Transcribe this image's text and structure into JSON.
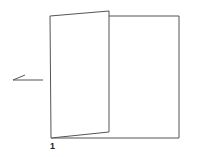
{
  "diagram": {
    "type": "fold-illustration",
    "step_label": "1",
    "stroke_color": "#555555",
    "background": "#ffffff",
    "elements": {
      "back_panel": {
        "x1": 109,
        "y1": 16,
        "x2": 179,
        "y2": 138
      },
      "folding_panel": {
        "points": [
          [
            50,
            16
          ],
          [
            109,
            11
          ],
          [
            109,
            132
          ],
          [
            51,
            138
          ]
        ]
      },
      "arrow": {
        "from": [
          43,
          80
        ],
        "to": [
          13,
          80
        ],
        "direction": "left"
      }
    }
  }
}
